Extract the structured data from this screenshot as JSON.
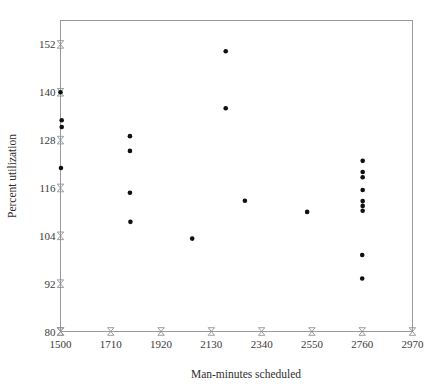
{
  "chart_data": {
    "type": "scatter",
    "title": "",
    "xlabel": "Man-minutes scheduled",
    "ylabel": "Percent utilization",
    "xlim": [
      1500,
      2970
    ],
    "ylim": [
      80,
      158
    ],
    "grid": false,
    "legend": "none",
    "xticks": [
      1500,
      1710,
      1920,
      2130,
      2340,
      2550,
      2760,
      2970
    ],
    "yticks": [
      80,
      92,
      104,
      116,
      128,
      140,
      152
    ],
    "marker": {
      "shape": "circle",
      "color": "#101010",
      "size": 4.6
    },
    "points": [
      {
        "x": 1500,
        "y": 140.0
      },
      {
        "x": 1505,
        "y": 133.0
      },
      {
        "x": 1505,
        "y": 131.3
      },
      {
        "x": 1502,
        "y": 121.0
      },
      {
        "x": 1790,
        "y": 129.0
      },
      {
        "x": 1790,
        "y": 125.3
      },
      {
        "x": 1790,
        "y": 114.8
      },
      {
        "x": 1792,
        "y": 107.5
      },
      {
        "x": 2050,
        "y": 103.3
      },
      {
        "x": 2190,
        "y": 150.3
      },
      {
        "x": 2190,
        "y": 136.0
      },
      {
        "x": 2270,
        "y": 112.8
      },
      {
        "x": 2530,
        "y": 110.0
      },
      {
        "x": 2762,
        "y": 122.8
      },
      {
        "x": 2762,
        "y": 120.0
      },
      {
        "x": 2762,
        "y": 118.7
      },
      {
        "x": 2762,
        "y": 115.5
      },
      {
        "x": 2762,
        "y": 112.7
      },
      {
        "x": 2762,
        "y": 111.5
      },
      {
        "x": 2762,
        "y": 110.3
      },
      {
        "x": 2760,
        "y": 99.2
      },
      {
        "x": 2760,
        "y": 93.3
      }
    ]
  }
}
